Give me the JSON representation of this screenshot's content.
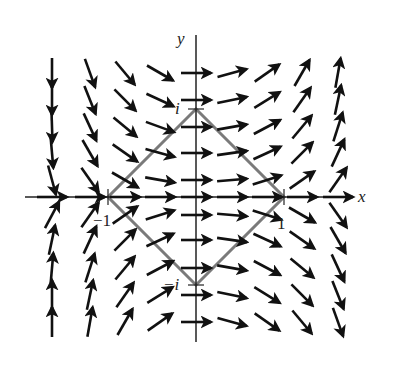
{
  "figure": {
    "origin_px": [
      196,
      197
    ],
    "unit_px": 88,
    "colors": {
      "arrows": "#111111",
      "axes": "#222222",
      "contour": "#7a7a7a",
      "background": "#ffffff"
    }
  },
  "axes": {
    "x_label": "x",
    "y_label": "y",
    "x_range_px": [
      25,
      352
    ],
    "y_range_px": [
      35,
      342
    ],
    "ticks": [
      {
        "label": "−1",
        "axis": "x",
        "value": -1
      },
      {
        "label": "1",
        "axis": "x",
        "value": 1
      },
      {
        "label": "i",
        "axis": "y",
        "value": 1
      },
      {
        "label": "−i",
        "axis": "y",
        "value": -1
      }
    ]
  },
  "contour": {
    "shape": "square (diamond) with vertices 1, i, -1, -i",
    "vertices": [
      [
        1,
        0
      ],
      [
        0,
        1
      ],
      [
        -1,
        0
      ],
      [
        0,
        -1
      ]
    ]
  },
  "vector_field": {
    "columns_px": [
      52,
      90,
      125,
      160,
      196,
      232,
      267,
      302,
      338
    ],
    "rows_px": [
      73,
      100,
      127,
      153,
      180,
      197,
      215,
      240,
      268,
      295,
      322
    ],
    "arrow_length_px": 30,
    "angles_deg": [
      [
        -90,
        -70,
        -50,
        -30,
        0,
        15,
        35,
        60,
        80,
        90
      ],
      [
        -90,
        -68,
        -45,
        -25,
        0,
        12,
        32,
        55,
        78,
        90
      ],
      [
        -88,
        -65,
        -40,
        -20,
        0,
        10,
        28,
        50,
        72,
        85
      ],
      [
        -85,
        -60,
        -35,
        -15,
        0,
        8,
        25,
        45,
        65,
        78
      ],
      [
        -75,
        -55,
        -30,
        -10,
        0,
        5,
        18,
        35,
        55,
        62
      ],
      [
        0,
        0,
        0,
        0,
        0,
        0,
        0,
        0,
        0,
        0
      ],
      [
        62,
        55,
        35,
        18,
        0,
        -5,
        -18,
        -30,
        -55,
        -62
      ],
      [
        78,
        65,
        45,
        25,
        0,
        -8,
        -25,
        -35,
        -60,
        -78
      ],
      [
        85,
        72,
        50,
        28,
        0,
        -10,
        -28,
        -40,
        -65,
        -85
      ],
      [
        90,
        78,
        55,
        32,
        0,
        -12,
        -32,
        -45,
        -68,
        -90
      ],
      [
        90,
        80,
        60,
        35,
        0,
        -15,
        -35,
        -50,
        -70,
        -90
      ]
    ]
  }
}
